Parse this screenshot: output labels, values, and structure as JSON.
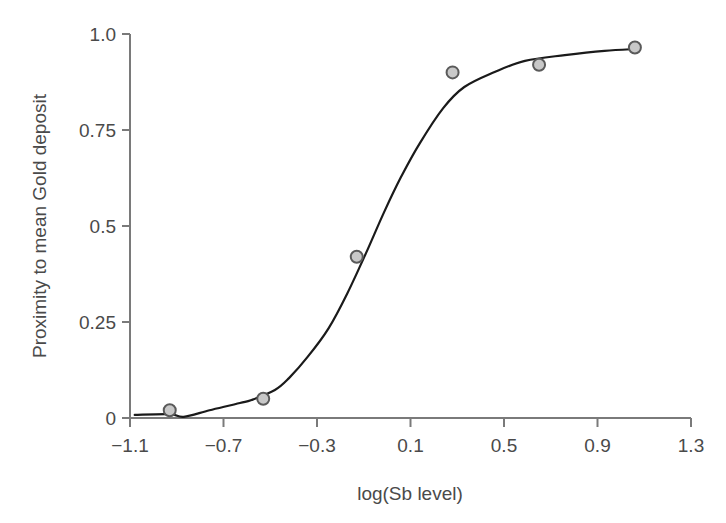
{
  "chart_data": {
    "type": "scatter",
    "title": "",
    "xlabel": "log(Sb level)",
    "ylabel": "Proximity to mean Gold deposit",
    "xlim": [
      -1.1,
      1.3
    ],
    "ylim": [
      0,
      1.0
    ],
    "grid": false,
    "legend": null,
    "x_ticks": [
      -1.1,
      -0.7,
      -0.3,
      0.1,
      0.5,
      0.9,
      1.3
    ],
    "x_tick_labels": [
      "−1.1",
      "−0.7",
      "−0.3",
      "0.1",
      "0.5",
      "0.9",
      "1.3"
    ],
    "y_ticks": [
      0,
      0.25,
      0.5,
      0.75,
      1.0
    ],
    "y_tick_labels": [
      "0",
      "0.25",
      "0.5",
      "0.75",
      "1.0"
    ],
    "series": [
      {
        "name": "observed",
        "type": "scatter",
        "x": [
          -0.93,
          -0.53,
          -0.13,
          0.28,
          0.65,
          1.06
        ],
        "y": [
          0.02,
          0.05,
          0.42,
          0.9,
          0.92,
          0.965
        ]
      },
      {
        "name": "fitted curve",
        "type": "line",
        "x": [
          -1.08,
          -0.93,
          -0.87,
          -0.76,
          -0.63,
          -0.58,
          -0.48,
          -0.42,
          -0.34,
          -0.25,
          -0.17,
          -0.09,
          -0.01,
          0.06,
          0.14,
          0.24,
          0.33,
          0.46,
          0.59,
          0.76,
          0.93,
          1.06
        ],
        "y": [
          0.008,
          0.01,
          0.003,
          0.02,
          0.039,
          0.047,
          0.073,
          0.104,
          0.159,
          0.234,
          0.325,
          0.43,
          0.54,
          0.628,
          0.716,
          0.807,
          0.862,
          0.901,
          0.93,
          0.945,
          0.956,
          0.961
        ]
      }
    ]
  },
  "style": {
    "background": "#ffffff",
    "axis_color": "#7a7a7a",
    "text_color": "#4a4a4a",
    "curve_color": "#1a1a1a",
    "marker_fill": "#c8c8c8",
    "marker_stroke": "#5a5a5a",
    "marker_radius": 6
  }
}
